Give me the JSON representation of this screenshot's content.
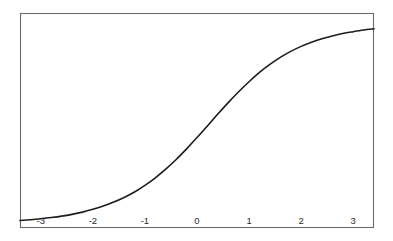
{
  "figure": {
    "background_color": "#ffffff",
    "frame_color": "#6b6b6b",
    "curve_color": "#1c1c1c",
    "label_color": "#2b2b2b",
    "plot_area": {
      "left": 20,
      "top": 13,
      "right": 374,
      "bottom": 228
    }
  },
  "chart_data": {
    "type": "line",
    "title": "",
    "subtitle": "",
    "xlabel": "",
    "ylabel": "",
    "grid": false,
    "legend": false,
    "legend_position": "none",
    "xlim": [
      -3.4,
      3.4
    ],
    "ylim": [
      -0.02,
      1.05
    ],
    "xticks": [
      -3,
      -2,
      -1,
      0,
      1,
      2,
      3
    ],
    "xticklabels": [
      "-3",
      "-2",
      "-1",
      "0",
      "1",
      "2",
      "3"
    ],
    "yticks": [],
    "yticklabels": [],
    "series": [
      {
        "name": "sigmoid",
        "x": [
          -3.4,
          -3.2,
          -3.0,
          -2.8,
          -2.6,
          -2.4,
          -2.2,
          -2.0,
          -1.8,
          -1.6,
          -1.4,
          -1.2,
          -1.0,
          -0.8,
          -0.6,
          -0.4,
          -0.2,
          0.0,
          0.2,
          0.4,
          0.6,
          0.8,
          1.0,
          1.2,
          1.4,
          1.6,
          1.8,
          2.0,
          2.2,
          2.4,
          2.6,
          2.8,
          3.0,
          3.2,
          3.4
        ],
        "y": [
          0.017,
          0.021,
          0.026,
          0.032,
          0.039,
          0.048,
          0.059,
          0.073,
          0.089,
          0.109,
          0.132,
          0.159,
          0.192,
          0.23,
          0.273,
          0.321,
          0.374,
          0.43,
          0.488,
          0.547,
          0.604,
          0.658,
          0.708,
          0.754,
          0.794,
          0.829,
          0.859,
          0.884,
          0.905,
          0.922,
          0.936,
          0.948,
          0.957,
          0.965,
          0.971
        ]
      }
    ]
  }
}
